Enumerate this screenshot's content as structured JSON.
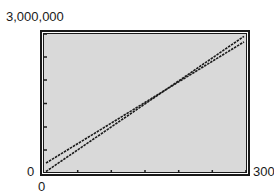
{
  "chart_data": {
    "type": "line",
    "title": "",
    "xlabel": "",
    "ylabel": "",
    "x": [
      0,
      300
    ],
    "xlim": [
      0,
      300
    ],
    "ylim": [
      0,
      3000000
    ],
    "x_ticks": [
      0,
      50,
      100,
      150,
      200,
      250,
      300
    ],
    "y_ticks": [
      0,
      500000,
      1000000,
      1500000,
      2000000,
      2500000,
      3000000
    ],
    "tick_labels": {
      "x_min": "0",
      "x_max": "300",
      "y_min": "0",
      "y_max": "3,000,000"
    },
    "grid": false,
    "legend": null,
    "series": [
      {
        "name": "line-1",
        "values": [
          0,
          2950000
        ]
      },
      {
        "name": "line-2",
        "values": [
          215000,
          2830000
        ]
      }
    ],
    "background": "#d9d9d9",
    "line_color": "#1a1a1a"
  }
}
